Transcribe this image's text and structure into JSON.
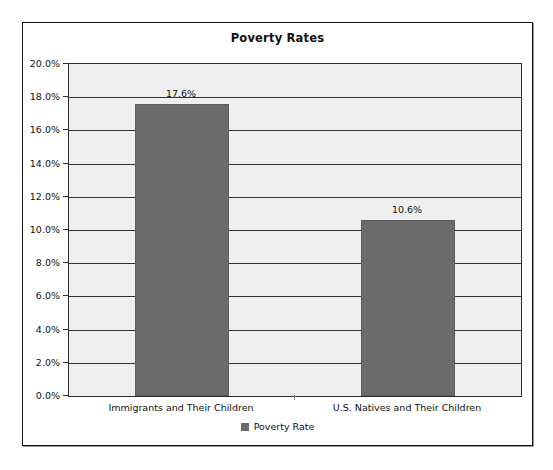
{
  "chart_data": {
    "type": "bar",
    "title": "Poverty Rates",
    "xlabel": "",
    "ylabel": "",
    "categories": [
      "Immigrants and Their Children",
      "U.S. Natives and Their Children"
    ],
    "values": [
      17.6,
      10.6
    ],
    "data_labels": [
      "17.6%",
      "10.6%"
    ],
    "series": [
      {
        "name": "Poverty Rate",
        "values": [
          17.6,
          10.6
        ],
        "color": "#6b6b6b"
      }
    ],
    "ylim": [
      0,
      20
    ],
    "ytick_values": [
      0,
      2,
      4,
      6,
      8,
      10,
      12,
      14,
      16,
      18,
      20
    ],
    "ytick_labels": [
      "0.0%",
      "2.0%",
      "4.0%",
      "6.0%",
      "8.0%",
      "10.0%",
      "12.0%",
      "14.0%",
      "16.0%",
      "18.0%",
      "20.0%"
    ],
    "grid": true,
    "legend_position": "bottom",
    "legend_entries": [
      "Poverty Rate"
    ],
    "plot_background": "#efefef",
    "gridline_color": "#333333",
    "frame_color": "#111111"
  }
}
